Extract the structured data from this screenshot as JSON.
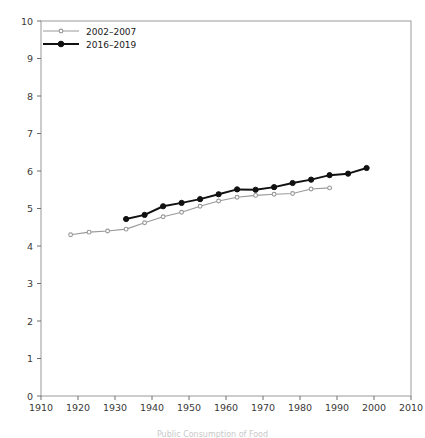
{
  "chart_data": {
    "type": "line",
    "title": "",
    "xlabel": "",
    "ylabel": "",
    "xlim": [
      1910,
      2010
    ],
    "ylim": [
      0,
      10
    ],
    "xticks": [
      1910,
      1920,
      1930,
      1940,
      1950,
      1960,
      1970,
      1980,
      1990,
      2000,
      2010
    ],
    "yticks": [
      0,
      1,
      2,
      3,
      4,
      5,
      6,
      7,
      8,
      9,
      10
    ],
    "grid": false,
    "legend_position": "top-left",
    "series": [
      {
        "name": "2002–2007",
        "color": "#999999",
        "marker": "circle-small",
        "x": [
          1918,
          1923,
          1928,
          1933,
          1938,
          1943,
          1948,
          1953,
          1958,
          1963,
          1968,
          1973,
          1978,
          1983,
          1988
        ],
        "values": [
          4.3,
          4.37,
          4.4,
          4.45,
          4.62,
          4.78,
          4.9,
          5.06,
          5.2,
          5.3,
          5.35,
          5.38,
          5.4,
          5.52,
          5.55
        ]
      },
      {
        "name": "2016–2019",
        "color": "#111111",
        "marker": "circle-filled",
        "x": [
          1933,
          1938,
          1943,
          1948,
          1953,
          1958,
          1963,
          1968,
          1973,
          1978,
          1983,
          1988,
          1993,
          1998
        ],
        "values": [
          4.72,
          4.83,
          5.06,
          5.15,
          5.25,
          5.38,
          5.51,
          5.5,
          5.57,
          5.68,
          5.77,
          5.89,
          5.93,
          6.08
        ]
      }
    ]
  },
  "axes": {
    "frame_color": "#9a9a9a",
    "tick_color": "#6e6e6e"
  },
  "caption": {
    "text": "Public Consumption of Food"
  }
}
